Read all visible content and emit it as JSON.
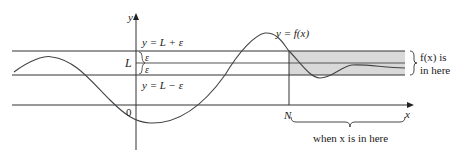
{
  "diagram": {
    "axes": {
      "x_label": "x",
      "y_label": "y",
      "origin_label": "0"
    },
    "lines": {
      "upper_label": "y = L + ε",
      "lower_label": "y = L − ε",
      "center_label": "L",
      "epsilon_upper": "ε",
      "epsilon_lower": "ε"
    },
    "curve_label": "y = f(x)",
    "N_label": "N",
    "fx_region_label_line1": "f(x) is",
    "fx_region_label_line2": "in here",
    "x_region_label": "when x is in here",
    "colors": {
      "shade": "#d9d9d9",
      "stroke": "#333333",
      "curve": "#444444"
    }
  }
}
